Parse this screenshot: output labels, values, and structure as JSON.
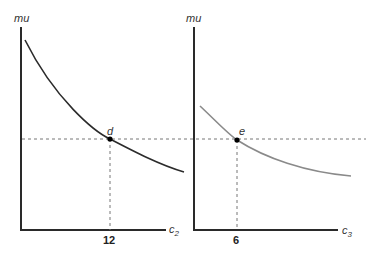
{
  "panels": [
    {
      "id": "left",
      "y_axis_label": "mu",
      "x_axis_label": "c",
      "x_axis_subscript": "2",
      "point_label": "d",
      "x_tick_label": "12",
      "curve_color": "#2b2b2b"
    },
    {
      "id": "right",
      "y_axis_label": "mu",
      "x_axis_label": "c",
      "x_axis_subscript": "3",
      "point_label": "e",
      "x_tick_label": "6",
      "curve_color": "#8a8a8a"
    }
  ],
  "colors": {
    "axis": "#2a2a2a",
    "guide": "#777777",
    "point": "#000000"
  }
}
